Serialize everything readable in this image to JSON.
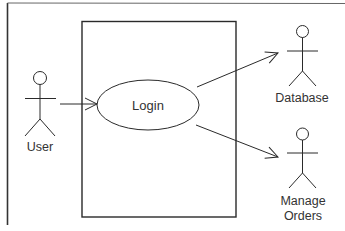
{
  "diagram": {
    "type": "uml-use-case",
    "colors": {
      "stroke": "#2a2a2a",
      "text": "#333333",
      "background": "#ffffff",
      "frame": "#555555"
    },
    "use_cases": [
      {
        "id": "login",
        "label": "Login"
      }
    ],
    "actors": [
      {
        "id": "user",
        "label_lines": [
          "User"
        ]
      },
      {
        "id": "database",
        "label_lines": [
          "Database"
        ]
      },
      {
        "id": "manage_orders",
        "label_lines": [
          "Manage",
          "Orders"
        ]
      }
    ],
    "associations": [
      {
        "from": "user",
        "to": "login"
      },
      {
        "from": "login",
        "to": "database"
      },
      {
        "from": "login",
        "to": "manage_orders"
      }
    ]
  }
}
